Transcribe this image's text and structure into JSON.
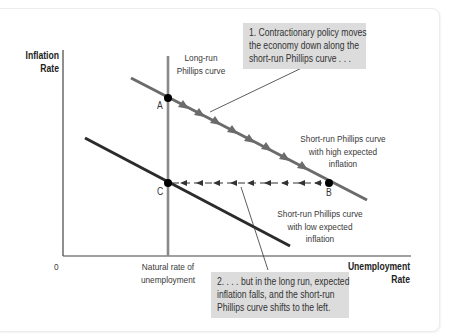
{
  "diagram": {
    "axes": {
      "y_label_line1": "Inflation",
      "y_label_line2": "Rate",
      "x_label_line1": "Unemployment",
      "x_label_line2": "Rate",
      "origin": "0",
      "natural_rate_line1": "Natural rate of",
      "natural_rate_line2": "unemployment"
    },
    "curves": {
      "long_run_line1": "Long-run",
      "long_run_line2": "Phillips curve",
      "srpc_high_line1": "Short-run Phillips curve",
      "srpc_high_line2": "with high expected",
      "srpc_high_line3": "inflation",
      "srpc_low_line1": "Short-run Phillips curve",
      "srpc_low_line2": "with low expected",
      "srpc_low_line3": "inflation"
    },
    "points": {
      "a": "A",
      "b": "B",
      "c": "C"
    },
    "callouts": {
      "one_line1": "1. Contractionary policy moves",
      "one_line2": "the economy down along the",
      "one_line3": "short-run Phillips curve . . .",
      "two_line1": "2. . . . but in the long run, expected",
      "two_line2": "inflation falls, and the short-run",
      "two_line3": "Phillips curve shifts to the left."
    },
    "colors": {
      "axis": "#444444",
      "long_run_curve": "#8a8a8a",
      "srpc_high": "#6b6b6b",
      "srpc_low": "#2b2b2b",
      "callout_bg": "#dcdcdc",
      "points": "#000000"
    }
  }
}
